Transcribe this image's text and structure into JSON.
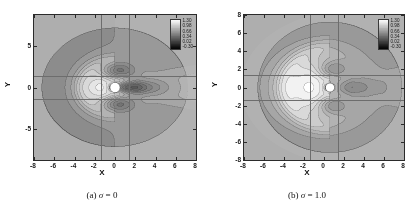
{
  "figure": {
    "type": "contour-pair",
    "panels": [
      {
        "id": "panel-a",
        "caption_prefix": "(a)",
        "caption_symbol": "σ",
        "caption_value": "= 0",
        "caption_full": "(a) σ = 0",
        "xlabel": "X",
        "ylabel": "Y",
        "xticks": [
          "-8",
          "-6",
          "-4",
          "-2",
          "0",
          "2",
          "4",
          "6",
          "8"
        ],
        "yticks": [
          "-5",
          "0",
          "5"
        ],
        "xlim": [
          -8,
          8
        ],
        "ylim": [
          -8.8,
          8.8
        ],
        "reference_lines_x": [
          -1.4,
          1.4
        ],
        "reference_lines_y": [
          -1.4,
          1.4
        ],
        "legend_labels": [
          "1.30",
          "0.98",
          "0.66",
          "0.34",
          "0.02",
          "-0.30"
        ]
      },
      {
        "id": "panel-b",
        "caption_prefix": "(b)",
        "caption_symbol": "σ",
        "caption_value": "= 1.0",
        "caption_full": "(b) σ = 1.0",
        "xlabel": "X",
        "ylabel": "Y",
        "xticks": [
          "-8",
          "-6",
          "-4",
          "-2",
          "0",
          "2",
          "4",
          "6",
          "8"
        ],
        "yticks": [
          "-8",
          "-6",
          "-4",
          "-2",
          "0",
          "2",
          "4",
          "6",
          "8"
        ],
        "xlim": [
          -8,
          8
        ],
        "ylim": [
          -8,
          8
        ],
        "reference_lines_x": [
          -1.4,
          1.4
        ],
        "reference_lines_y": [
          -1.4,
          1.4
        ],
        "legend_labels": [
          "1.30",
          "0.98",
          "0.66",
          "0.34",
          "0.02",
          "-0.30"
        ]
      }
    ]
  },
  "chart_data": [
    {
      "type": "heatmap",
      "title": "(a) σ = 0",
      "xlabel": "X",
      "ylabel": "Y",
      "xlim": [
        -8,
        8
      ],
      "ylim": [
        -8.8,
        8.8
      ],
      "xticks": [
        -8,
        -6,
        -4,
        -2,
        0,
        2,
        4,
        6,
        8
      ],
      "yticks": [
        -5,
        0,
        5
      ],
      "grid": false,
      "colormap": "grayscale",
      "colorbar": {
        "labels": [
          "1.30",
          "0.98",
          "0.66",
          "0.34",
          "0.02",
          "-0.30"
        ],
        "values": [
          1.3,
          0.98,
          0.66,
          0.34,
          0.02,
          -0.3
        ],
        "vmin": -0.3,
        "vmax": 1.3,
        "step": 0.32,
        "position": "inset-top-right"
      },
      "annotations": [
        "white circular body centered at (0, 0) radius ~0.5",
        "dark low-value lobe immediately downstream of body",
        "symmetric contour lobes above and below centerline",
        "elongated streamwise wake extending to X = 8",
        "large upstream contour loop centered near X = -3.3",
        "vertical reference lines at X = -1.4 and X = 1.4",
        "horizontal reference lines at Y = -1.4 and Y = 1.4"
      ],
      "field_model": {
        "body_center": [
          0,
          0
        ],
        "body_radius": 0.5,
        "wake_sigma": 0,
        "background_value": 0.62
      }
    },
    {
      "type": "heatmap",
      "title": "(b) σ = 1.0",
      "xlabel": "X",
      "ylabel": "Y",
      "xlim": [
        -8,
        8
      ],
      "ylim": [
        -8,
        8
      ],
      "xticks": [
        -8,
        -6,
        -4,
        -2,
        0,
        2,
        4,
        6,
        8
      ],
      "yticks": [
        -8,
        -6,
        -4,
        -2,
        0,
        2,
        4,
        6,
        8
      ],
      "grid": false,
      "colormap": "grayscale",
      "colorbar": {
        "labels": [
          "1.30",
          "0.98",
          "0.66",
          "0.34",
          "0.02",
          "-0.30"
        ],
        "values": [
          1.3,
          0.98,
          0.66,
          0.34,
          0.02,
          -0.3
        ],
        "vmin": -0.3,
        "vmax": 1.3,
        "step": 0.32,
        "position": "inset-top-right"
      },
      "annotations": [
        "white circular body centered at (0.6, 0) radius ~0.45",
        "dark crescent of low values wrapping the upstream face",
        "broad bright upstream bulb extending to X = -6",
        "narrow dark wake band along centerline downstream",
        "vertical reference lines at X = -1.4 and X = 1.4",
        "horizontal reference lines at Y = -1.4 and Y = 1.4"
      ],
      "field_model": {
        "body_center": [
          0.6,
          0
        ],
        "body_radius": 0.45,
        "wake_sigma": 1.0,
        "background_value": 0.62
      }
    }
  ]
}
